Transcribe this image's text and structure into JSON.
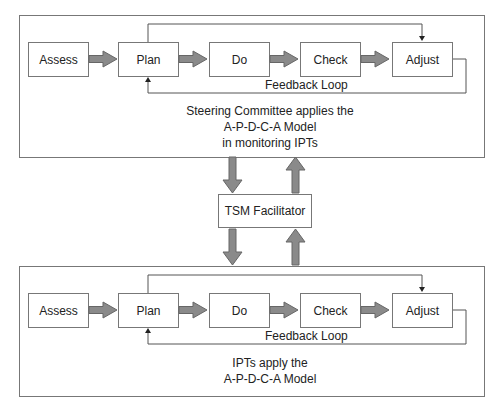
{
  "top_panel": {
    "steps": [
      "Assess",
      "Plan",
      "Do",
      "Check",
      "Adjust"
    ],
    "feedback_label": "Feedback Loop",
    "caption": [
      "Steering Committee applies the",
      "A-P-D-C-A Model",
      "in monitoring IPTs"
    ]
  },
  "facilitator": {
    "label": "TSM Facilitator"
  },
  "bottom_panel": {
    "steps": [
      "Assess",
      "Plan",
      "Do",
      "Check",
      "Adjust"
    ],
    "feedback_label": "Feedback Loop",
    "caption": [
      "IPTs apply the",
      "A-P-D-C-A Model"
    ]
  },
  "colors": {
    "line": "#777777",
    "arrow_fill": "#8a8a8a",
    "text": "#222222"
  }
}
